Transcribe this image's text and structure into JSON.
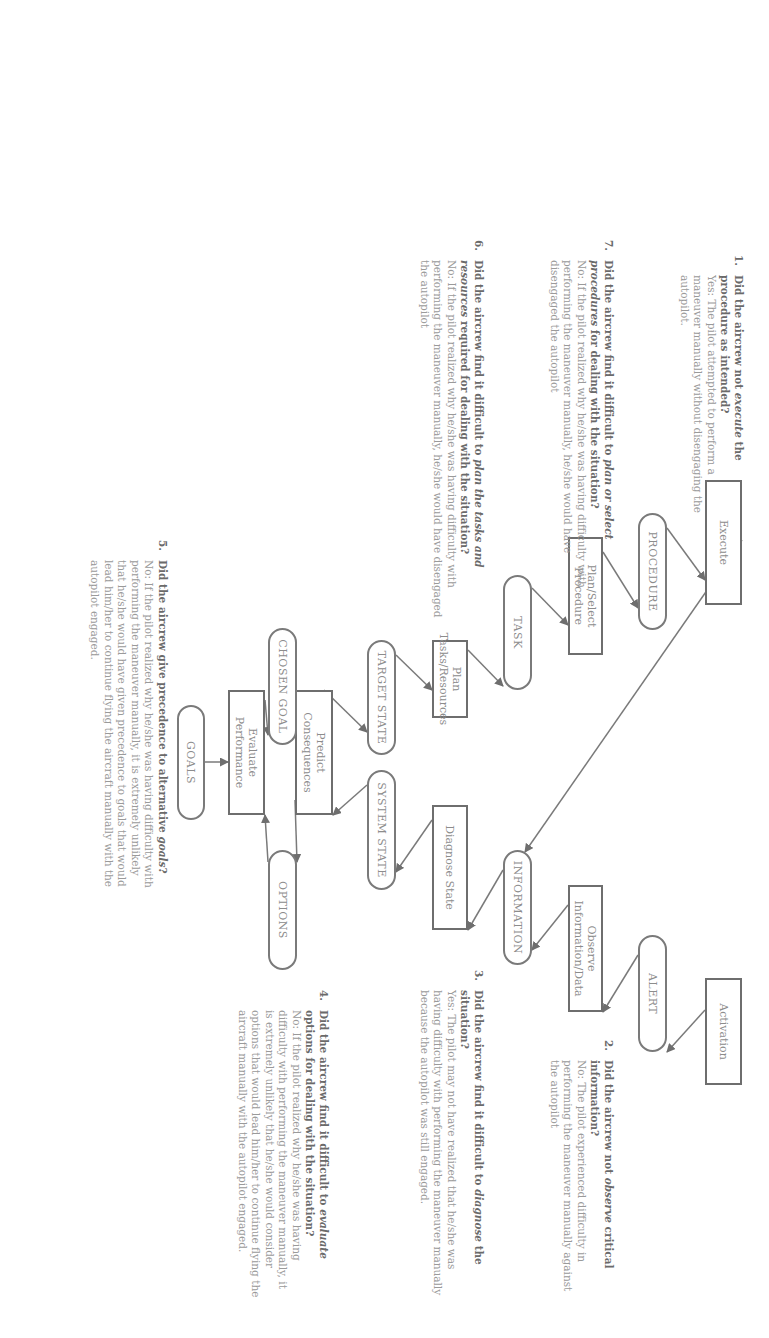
{
  "diagram": {
    "orientation": "rotated 90 degrees clockwise",
    "nodes": {
      "goals": "GOALS",
      "options": "OPTIONS",
      "chosen_goal": "CHOSEN GOAL",
      "evaluate": "Evaluate Performance",
      "predict": "Predict Consequences",
      "target_state": "TARGET STATE",
      "system_state": "SYSTEM STATE",
      "plan_tasks": "Plan Tasks/Resources",
      "diagnose": "Diagnose State",
      "task": "TASK",
      "information": "INFORMATION",
      "plan_select": "Plan/Select Procedure",
      "observe": "Observe Information/Data",
      "procedure": "PROCEDURE",
      "alert": "ALERT",
      "execute": "Execute",
      "activation": "Activation"
    },
    "edges": [
      [
        "Activation",
        "ALERT"
      ],
      [
        "ALERT",
        "Observe Information/Data"
      ],
      [
        "Observe Information/Data",
        "INFORMATION"
      ],
      [
        "INFORMATION",
        "Diagnose State"
      ],
      [
        "Diagnose State",
        "SYSTEM STATE"
      ],
      [
        "SYSTEM STATE",
        "Predict Consequences"
      ],
      [
        "Predict Consequences",
        "OPTIONS"
      ],
      [
        "OPTIONS",
        "Evaluate Performance"
      ],
      [
        "GOALS",
        "Evaluate Performance"
      ],
      [
        "Evaluate Performance",
        "CHOSEN GOAL"
      ],
      [
        "CHOSEN GOAL",
        "Predict Consequences"
      ],
      [
        "Predict Consequences",
        "TARGET STATE"
      ],
      [
        "TARGET STATE",
        "Plan Tasks/Resources"
      ],
      [
        "Plan Tasks/Resources",
        "TASK"
      ],
      [
        "TASK",
        "Plan/Select Procedure"
      ],
      [
        "Plan/Select Procedure",
        "PROCEDURE"
      ],
      [
        "PROCEDURE",
        "Execute"
      ],
      [
        "Execute",
        "INFORMATION"
      ]
    ]
  },
  "questions": {
    "q1": {
      "number": "1.",
      "head_a": "Did the aircrew not ",
      "head_em": "execute",
      "head_b": " the procedure as intended?",
      "answer": "Yes: The pilot attempted to perform a maneuver manually without disengaging the autopilot."
    },
    "q2": {
      "number": "2.",
      "head_a": "Did the aircrew not ",
      "head_em": "observe",
      "head_b": " critical information?",
      "answer": "No: The pilot experienced difficulty in performing the maneuver manually against the autopilot"
    },
    "q3": {
      "number": "3.",
      "head_a": "Did the aircrew find it difficult to ",
      "head_em": "diagnose",
      "head_b": " the situation?",
      "answer": "Yes: The pilot may not have realized that he/she was having difficulty with performing the maneuver manually because the autopilot was still engaged."
    },
    "q4": {
      "number": "4.",
      "head_a": "Did the aircrew find it difficult to ",
      "head_em": "evaluate",
      "head_b": " options for dealing with the situation?",
      "answer": "No: If the pilot realized why he/she was having difficulty with performing the maneuver manually, it is extremely unlikely that he/she would consider options that would lead him/her to continue flying the aircraft manually with the autopilot engaged."
    },
    "q5": {
      "number": "5.",
      "head_a": "Did the aircrew give precedence to alternative ",
      "head_em": "goals",
      "head_b": "?",
      "answer": "No: If the pilot realized why he/she was having difficulty with performing the maneuver manually, it is extremely unlikely that he/she would have given precedence to goals that would lead him/her to continue flying the aircraft manually with the autopilot engaged."
    },
    "q6": {
      "number": "6.",
      "head_a": "Did the aircrew find it difficult to ",
      "head_em": "plan the tasks and resources",
      "head_b": " required for dealing with the situation?",
      "answer": "No: If the pilot realized why he/she was having difficulty with performing the maneuver manually, he/she would have disengaged the autopilot"
    },
    "q7": {
      "number": "7.",
      "head_a": "Did the aircrew find it difficult to ",
      "head_em": "plan or select procedures",
      "head_b": " for dealing with the situation?",
      "answer": "No: If the pilot realized why he/she was having difficulty with performing the maneuver manually, he/she would have disengaged the autopilot"
    }
  }
}
